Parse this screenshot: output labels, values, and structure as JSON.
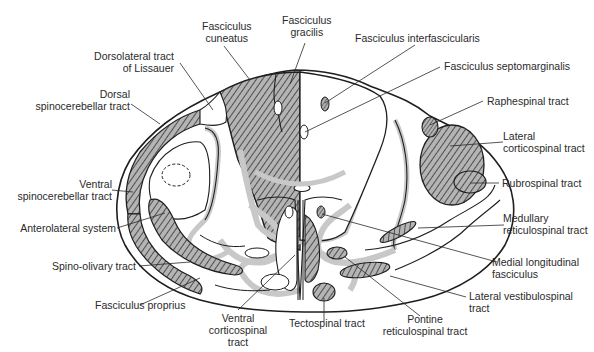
{
  "diagram": {
    "colors": {
      "outline": "#1e1e1e",
      "gray_matter_border": "#c8c8c8",
      "hatch": "#3a3a3a",
      "hatch_fill": "#9a9a9a",
      "background": "#ffffff"
    },
    "labels": {
      "fasciculus_cuneatus": [
        "Fasciculus",
        "cuneatus"
      ],
      "fasciculus_gracilis": [
        "Fasciculus",
        "gracilis"
      ],
      "fasciculus_interfascicularis": "Fasciculus interfascicularis",
      "fasciculus_septomarginalis": "Fasciculus septomarginalis",
      "dorsolateral_tract": [
        "Dorsolateral tract",
        "of Lissauer"
      ],
      "dorsal_spinocerebellar": [
        "Dorsal",
        "spinocerebellar tract"
      ],
      "raphespinal": "Raphespinal tract",
      "lateral_corticospinal": [
        "Lateral",
        "corticospinal tract"
      ],
      "rubrospinal": "Rubrospinal tract",
      "ventral_spinocerebellar": [
        "Ventral",
        "spinocerebellar tract"
      ],
      "anterolateral_system": "Anterolateral system",
      "spino_olivary": "Spino-olivary tract",
      "fasciculus_proprius": "Fasciculus proprius",
      "ventral_corticospinal": [
        "Ventral",
        "corticospinal",
        "tract"
      ],
      "tectospinal": "Tectospinal tract",
      "pontine_reticulospinal": [
        "Pontine",
        "reticulospinal tract"
      ],
      "medullary_reticulospinal": [
        "Medullary",
        "reticulospinal tract"
      ],
      "medial_longitudinal": [
        "Medial longitudinal",
        "fasciculus"
      ],
      "lateral_vestibulospinal": [
        "Lateral vestibulospinal",
        "tract"
      ]
    }
  }
}
